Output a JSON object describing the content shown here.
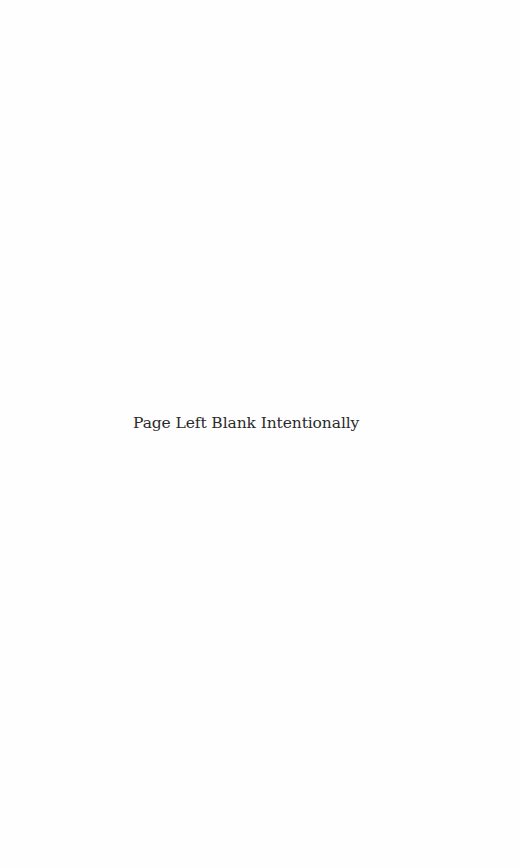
{
  "page": {
    "notice_text": "Page Left Blank Intentionally",
    "background_color": "#fefefe",
    "text_color": "#2b2b2b"
  }
}
